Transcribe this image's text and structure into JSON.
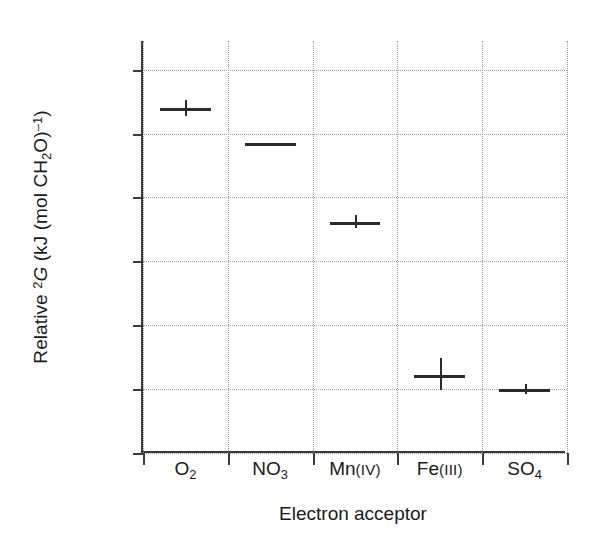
{
  "chart_data": {
    "type": "scatter",
    "title": "",
    "xlabel": "Electron acceptor",
    "ylabel": "Relative 2G (kJ (mol CH2O)-1)",
    "ylabel_parts": {
      "prefix": "Relative ",
      "delta": "2",
      "symbol": "G",
      "unit_open": " (kJ (mol CH",
      "unit_sub": "2",
      "unit_mid": "O)",
      "unit_sup": "–1",
      "unit_close": ")"
    },
    "categories": [
      "O2",
      "NO3",
      "Mn(IV)",
      "Fe(III)",
      "SO4"
    ],
    "category_labels": [
      {
        "base": "O",
        "sub": "2",
        "paren": ""
      },
      {
        "base": "NO",
        "sub": "3",
        "paren": ""
      },
      {
        "base": "Mn",
        "sub": "",
        "paren": "(IV)"
      },
      {
        "base": "Fe",
        "sub": "",
        "paren": "(III)"
      },
      {
        "base": "SO",
        "sub": "4",
        "paren": ""
      }
    ],
    "values": [
      -540,
      -486,
      -362,
      -122,
      -100
    ],
    "err_low": [
      -528,
      -486,
      -352,
      -98,
      -92
    ],
    "err_high": [
      -552,
      -486,
      -372,
      -148,
      -108
    ],
    "yticks": [
      -600,
      -500,
      -400,
      -300,
      -200,
      -100,
      0
    ],
    "ytick_labels": [
      "–600",
      "–500",
      "–400",
      "–300",
      "–200",
      "–100",
      "0"
    ],
    "ylim": [
      -645,
      0
    ],
    "grid": true,
    "grid_style": "dotted",
    "legend": "none",
    "series_color": "#2a2a2a",
    "grid_color": "#9a9a9a",
    "axis_color": "#3a3a3a",
    "background": "#ffffff"
  }
}
